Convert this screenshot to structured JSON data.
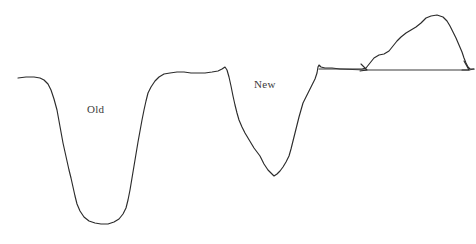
{
  "figure": {
    "title": "",
    "background_color": "#ffffff",
    "line_color": "#2b2b2b",
    "width": 476,
    "height": 244
  },
  "annotations": {
    "old_label": "Old",
    "new_label": "New"
  },
  "chart_data": {
    "type": "line",
    "title": "",
    "xlabel": "",
    "ylabel": "",
    "grid": false,
    "legend_position": "none",
    "xlim": [
      0,
      476
    ],
    "ylim": [
      244,
      0
    ],
    "axis_note": "y values are screen pixels, smaller y = higher signal",
    "annotations": [
      {
        "text": "Old",
        "x": 87,
        "y": 110
      },
      {
        "text": "New",
        "x": 254,
        "y": 85
      }
    ],
    "series": [
      {
        "name": "profile-trace",
        "stroke": "#2b2b2b",
        "points": [
          [
            18,
            78
          ],
          [
            26,
            77
          ],
          [
            34,
            77
          ],
          [
            40,
            78
          ],
          [
            44,
            80
          ],
          [
            48,
            84
          ],
          [
            51,
            90
          ],
          [
            54,
            99
          ],
          [
            57,
            110
          ],
          [
            59,
            121
          ],
          [
            61,
            132
          ],
          [
            63,
            143
          ],
          [
            65,
            152
          ],
          [
            67,
            161
          ],
          [
            69,
            170
          ],
          [
            71,
            178
          ],
          [
            73,
            187
          ],
          [
            75,
            196
          ],
          [
            77,
            204
          ],
          [
            80,
            211
          ],
          [
            84,
            217
          ],
          [
            89,
            221
          ],
          [
            95,
            223
          ],
          [
            101,
            224
          ],
          [
            108,
            224
          ],
          [
            114,
            222
          ],
          [
            119,
            219
          ],
          [
            123,
            214
          ],
          [
            126,
            208
          ],
          [
            128,
            200
          ],
          [
            130,
            190
          ],
          [
            132,
            178
          ],
          [
            134,
            166
          ],
          [
            136,
            154
          ],
          [
            138,
            142
          ],
          [
            140,
            131
          ],
          [
            142,
            120
          ],
          [
            144,
            110
          ],
          [
            146,
            101
          ],
          [
            148,
            93
          ],
          [
            151,
            87
          ],
          [
            155,
            81
          ],
          [
            159,
            77
          ],
          [
            164,
            74
          ],
          [
            170,
            73
          ],
          [
            177,
            72
          ],
          [
            184,
            72
          ],
          [
            191,
            73
          ],
          [
            198,
            73
          ],
          [
            205,
            73
          ],
          [
            212,
            72
          ],
          [
            218,
            71
          ],
          [
            222,
            69
          ],
          [
            225,
            67
          ],
          [
            227,
            70
          ],
          [
            229,
            77
          ],
          [
            231,
            86
          ],
          [
            233,
            96
          ],
          [
            235,
            105
          ],
          [
            237,
            113
          ],
          [
            239,
            120
          ],
          [
            242,
            127
          ],
          [
            245,
            133
          ],
          [
            248,
            138
          ],
          [
            251,
            143
          ],
          [
            254,
            148
          ],
          [
            257,
            152
          ],
          [
            260,
            156
          ],
          [
            262,
            160
          ],
          [
            264,
            164
          ],
          [
            266,
            167
          ],
          [
            268,
            170
          ],
          [
            271,
            173
          ],
          [
            274,
            176
          ],
          [
            277,
            174
          ],
          [
            280,
            171
          ],
          [
            283,
            167
          ],
          [
            286,
            162
          ],
          [
            289,
            156
          ],
          [
            291,
            149
          ],
          [
            293,
            141
          ],
          [
            295,
            133
          ],
          [
            297,
            125
          ],
          [
            299,
            117
          ],
          [
            301,
            110
          ],
          [
            303,
            103
          ],
          [
            306,
            97
          ],
          [
            309,
            91
          ],
          [
            312,
            85
          ],
          [
            315,
            79
          ],
          [
            317,
            73
          ],
          [
            318,
            67
          ],
          [
            319,
            65
          ],
          [
            321,
            67
          ],
          [
            325,
            68
          ],
          [
            332,
            68
          ],
          [
            340,
            69
          ],
          [
            348,
            69
          ],
          [
            356,
            69
          ],
          [
            362,
            69
          ],
          [
            366,
            68
          ],
          [
            370,
            63
          ],
          [
            374,
            58
          ],
          [
            379,
            55
          ],
          [
            384,
            54
          ],
          [
            389,
            51
          ],
          [
            393,
            46
          ],
          [
            397,
            41
          ],
          [
            401,
            37
          ],
          [
            406,
            33
          ],
          [
            411,
            30
          ],
          [
            416,
            27
          ],
          [
            421,
            23
          ],
          [
            426,
            18
          ],
          [
            431,
            16
          ],
          [
            437,
            15
          ],
          [
            443,
            17
          ],
          [
            447,
            21
          ],
          [
            450,
            26
          ],
          [
            453,
            32
          ],
          [
            456,
            38
          ],
          [
            459,
            45
          ],
          [
            462,
            52
          ],
          [
            464,
            58
          ],
          [
            466,
            63
          ],
          [
            468,
            67
          ],
          [
            470,
            69
          ],
          [
            474,
            69
          ]
        ]
      },
      {
        "name": "baseline-segment",
        "stroke": "#3a3a3a",
        "points": [
          [
            319,
            69
          ],
          [
            340,
            69
          ],
          [
            365,
            70
          ],
          [
            400,
            70
          ],
          [
            430,
            70
          ],
          [
            455,
            70
          ],
          [
            469,
            70
          ],
          [
            474,
            69
          ]
        ]
      }
    ],
    "markers": [
      {
        "name": "left-arrowhead",
        "x": 365,
        "y": 70
      },
      {
        "name": "right-arrowhead",
        "x": 468,
        "y": 70
      }
    ]
  }
}
